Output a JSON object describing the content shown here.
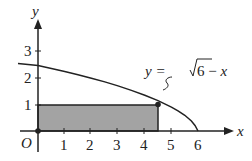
{
  "chart_data": {
    "type": "area",
    "title": "",
    "xlabel": "x",
    "ylabel": "y",
    "origin_label": "O",
    "x_ticks": [
      "1",
      "2",
      "3",
      "4",
      "5",
      "6"
    ],
    "y_ticks": [
      "1",
      "2",
      "3"
    ],
    "curve": {
      "label": "y = √6 − x",
      "equation": "y = sqrt(6 - x)",
      "domain": [
        0,
        6
      ]
    },
    "rectangle": {
      "x0": 0,
      "y0": 0,
      "x1": 4.5,
      "y1": 1.22,
      "fill": "#a0a0a0"
    },
    "point": {
      "x": 4.5,
      "y": 1.22
    },
    "xlim": [
      0,
      6.8
    ],
    "ylim": [
      0,
      3.8
    ]
  },
  "labels": {
    "y_axis": "y",
    "x_axis": "x",
    "origin": "O",
    "eq_left": "y = ",
    "eq_right": "6 − x",
    "t1": "1",
    "t2": "2",
    "t3": "3",
    "t4": "4",
    "t5": "5",
    "t6": "6",
    "y1": "1",
    "y2": "2",
    "y3": "3"
  }
}
